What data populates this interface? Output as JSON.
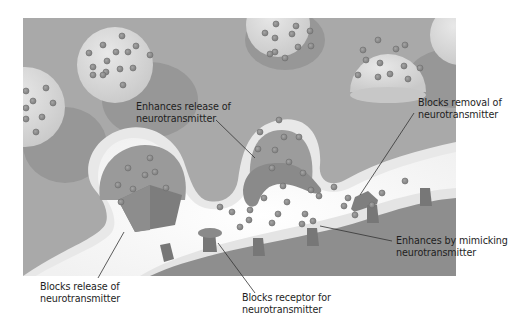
{
  "diagram": {
    "colors": {
      "background": "#ffffff",
      "presynaptic_fill": "#a9a9a9",
      "vesicle_fill": "#dcdcdc",
      "vesicle_shadow": "#8f8f8f",
      "membrane": "#e6e6e6",
      "cleft": "#f7f7f7",
      "postsynaptic_fill": "#8c8c8c",
      "neurotransmitter": "#8a8a8a",
      "receptor": "#7a7a7a",
      "drug_shape": "#7c7c7c",
      "label_text": "#1e1e1e",
      "leader_line": "#333333"
    },
    "labels": [
      {
        "id": "enhances-release",
        "line1": "Enhances release of",
        "line2": "neurotransmitter"
      },
      {
        "id": "blocks-removal",
        "line1": "Blocks removal of",
        "line2": "neurotransmitter"
      },
      {
        "id": "blocks-release",
        "line1": "Blocks release of",
        "line2": "neurotransmitter"
      },
      {
        "id": "blocks-receptor",
        "line1": "Blocks receptor for",
        "line2": "neurotransmitter"
      },
      {
        "id": "enhances-mimicking",
        "line1": "Enhances by mimicking",
        "line2": "neurotransmitter"
      }
    ]
  }
}
